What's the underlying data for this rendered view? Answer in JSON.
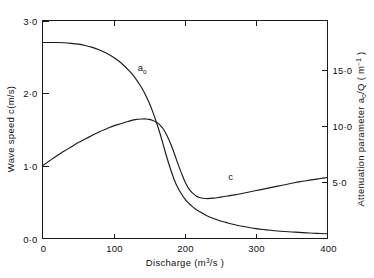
{
  "chart_data": {
    "type": "line",
    "title": "",
    "xlabel": "Discharge (m3/s)",
    "xlabel_parts": {
      "base": "Discharge  (m",
      "sup": "3",
      "tail": "/s )"
    },
    "ylabel": "Wave speed c(m/s)",
    "y2label": "Attenuation parameter ao/Q (m-1)",
    "y2label_parts": {
      "base": "Attenuation  parameter  a",
      "sub": "o",
      "mid": "/Q ( m",
      "sup": "−1",
      "tail": " )"
    },
    "xlim": [
      0,
      400
    ],
    "ylim": [
      0.0,
      3.0
    ],
    "y2lim": [
      0.0,
      19.355
    ],
    "grid": false,
    "legend_position": "inline-labels",
    "xticks": [
      0,
      100,
      200,
      300,
      400
    ],
    "xtick_labels": [
      "0",
      "100",
      "200",
      "300",
      "400"
    ],
    "yticks": [
      0.0,
      1.0,
      2.0,
      3.0
    ],
    "ytick_labels": [
      "0·0",
      "1·0",
      "2·0",
      "3·0"
    ],
    "y2ticks": [
      5.0,
      10.0,
      15.0
    ],
    "y2tick_labels": [
      "5·0",
      "10·0",
      "15·0"
    ],
    "series": [
      {
        "name": "ao",
        "label": "a",
        "label_sub": "o",
        "axis": "right",
        "label_x": 140,
        "label_y": 2.3,
        "x": [
          0,
          10,
          20,
          30,
          40,
          50,
          60,
          70,
          80,
          90,
          100,
          110,
          120,
          125,
          130,
          135,
          140,
          145,
          150,
          155,
          160,
          165,
          170,
          175,
          180,
          185,
          190,
          195,
          200,
          205,
          210,
          215,
          220,
          230,
          240,
          250,
          260,
          270,
          280,
          290,
          300,
          310,
          320,
          330,
          340,
          350,
          360,
          370,
          380,
          390,
          400
        ],
        "values": [
          17.4,
          17.4,
          17.4,
          17.38,
          17.33,
          17.26,
          17.14,
          16.97,
          16.74,
          16.45,
          16.07,
          15.6,
          15.0,
          14.65,
          14.26,
          13.8,
          13.3,
          12.7,
          12.0,
          11.2,
          10.3,
          9.3,
          8.2,
          7.1,
          6.1,
          5.2,
          4.5,
          3.95,
          3.5,
          3.15,
          2.85,
          2.6,
          2.4,
          2.05,
          1.78,
          1.56,
          1.38,
          1.22,
          1.09,
          0.98,
          0.88,
          0.8,
          0.73,
          0.67,
          0.62,
          0.58,
          0.54,
          0.5,
          0.47,
          0.44,
          0.42
        ]
      },
      {
        "name": "c",
        "label": "c",
        "axis": "left",
        "label_x": 264,
        "label_y": 0.8,
        "x": [
          0,
          10,
          20,
          30,
          40,
          50,
          60,
          70,
          80,
          90,
          100,
          110,
          120,
          130,
          140,
          145,
          150,
          155,
          160,
          165,
          170,
          175,
          180,
          185,
          190,
          195,
          200,
          205,
          210,
          215,
          220,
          230,
          240,
          250,
          260,
          270,
          280,
          290,
          300,
          310,
          320,
          330,
          340,
          350,
          360,
          370,
          380,
          390,
          400
        ],
        "values": [
          1.0,
          1.07,
          1.14,
          1.2,
          1.26,
          1.32,
          1.37,
          1.42,
          1.47,
          1.51,
          1.55,
          1.58,
          1.61,
          1.635,
          1.645,
          1.645,
          1.64,
          1.625,
          1.6,
          1.56,
          1.5,
          1.41,
          1.3,
          1.17,
          1.03,
          0.9,
          0.78,
          0.69,
          0.63,
          0.59,
          0.565,
          0.55,
          0.555,
          0.57,
          0.585,
          0.6,
          0.62,
          0.64,
          0.66,
          0.68,
          0.7,
          0.72,
          0.74,
          0.76,
          0.78,
          0.795,
          0.81,
          0.825,
          0.84
        ]
      }
    ]
  }
}
